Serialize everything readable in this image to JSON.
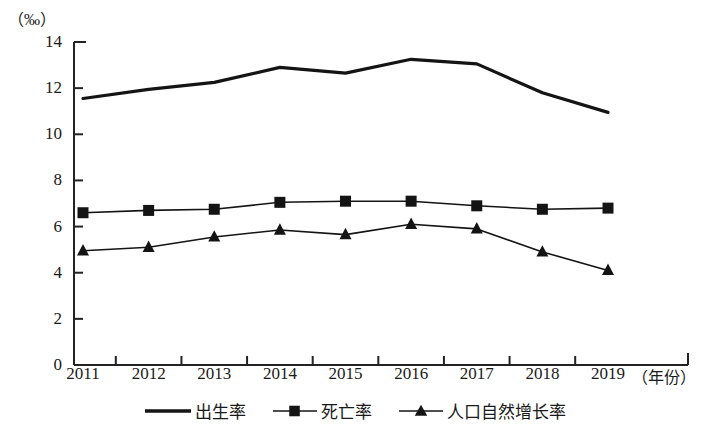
{
  "chart_data": {
    "type": "line",
    "title": "",
    "unit_label": "（‰）",
    "xlabel": "（年份）",
    "ylabel": "",
    "categories": [
      "2011",
      "2012",
      "2013",
      "2014",
      "2015",
      "2016",
      "2017",
      "2018",
      "2019"
    ],
    "ylim": [
      0,
      14
    ],
    "yticks": [
      0,
      2,
      4,
      6,
      8,
      10,
      12,
      14
    ],
    "ytick_labels": [
      "0",
      "2",
      "4",
      "6",
      "8",
      "10",
      "12",
      "14"
    ],
    "grid": false,
    "legend_position": "bottom",
    "series": [
      {
        "name": "出生率",
        "marker": "none",
        "color": "#141414",
        "values": [
          11.55,
          11.95,
          12.25,
          12.9,
          12.65,
          13.25,
          13.05,
          11.8,
          10.95
        ]
      },
      {
        "name": "死亡率",
        "marker": "square",
        "color": "#141414",
        "values": [
          6.6,
          6.7,
          6.75,
          7.05,
          7.1,
          7.1,
          6.9,
          6.75,
          6.8
        ]
      },
      {
        "name": "人口自然增长率",
        "marker": "triangle",
        "color": "#141414",
        "values": [
          4.95,
          5.1,
          5.55,
          5.85,
          5.65,
          6.1,
          5.9,
          4.9,
          4.1
        ]
      }
    ]
  },
  "legend": {
    "items": [
      {
        "label": "出生率",
        "marker": "line-plain"
      },
      {
        "label": "死亡率",
        "marker": "line-square"
      },
      {
        "label": "人口自然增长率",
        "marker": "line-triangle"
      }
    ]
  },
  "axes": {
    "unit": "（‰）",
    "x_title": "（年份）"
  }
}
